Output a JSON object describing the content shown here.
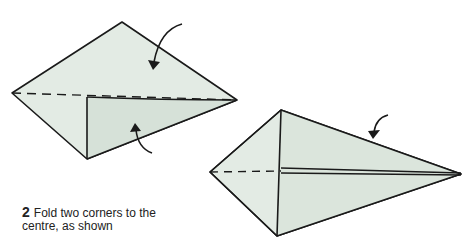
{
  "diagram": {
    "type": "origami-instruction",
    "step": {
      "number": "2",
      "line1": "Fold two corners to the",
      "line2": "centre, as shown"
    },
    "colors": {
      "paper": "#e3ebe4",
      "paper_shade": "#d3dfd5",
      "line": "#1a1a1a",
      "background": "#ffffff"
    },
    "figures": [
      {
        "id": "before",
        "description": "Kite shape with one corner folded to centre crease, arrows indicating folds"
      },
      {
        "id": "after",
        "description": "Narrow kite shape with both corners folded to centre"
      }
    ]
  }
}
